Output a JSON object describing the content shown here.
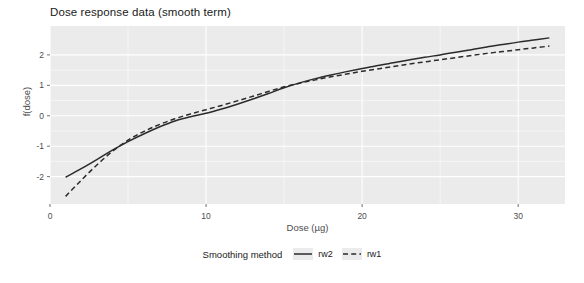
{
  "chart_data": {
    "type": "line",
    "title": "Dose response data (smooth term)",
    "xlabel": "Dose (µg)",
    "ylabel": "f(dose)",
    "xlim": [
      0,
      33
    ],
    "ylim": [
      -2.9,
      2.95
    ],
    "xticks": [
      0,
      10,
      20,
      30
    ],
    "xticklabels": [
      "0",
      "10",
      "20",
      "30"
    ],
    "yticks": [
      -2,
      -1,
      0,
      1,
      2
    ],
    "yticklabels": [
      "-2",
      "-1",
      "0",
      "1",
      "2"
    ],
    "grid": true,
    "grid_color": "#ffffff",
    "panel_color": "#ebebeb",
    "legend": {
      "title": "Smoothing method",
      "position": "bottom",
      "entries": [
        {
          "label": "rw2",
          "style": "solid",
          "color": "#2b2b2b"
        },
        {
          "label": "rw1",
          "style": "dashed",
          "color": "#2b2b2b"
        }
      ]
    },
    "series": [
      {
        "name": "rw2",
        "style": "solid",
        "color": "#2b2b2b",
        "x": [
          1.0,
          2.0,
          3.0,
          4.0,
          5.0,
          6.0,
          7.0,
          8.0,
          9.0,
          10.0,
          11.0,
          12.0,
          13.0,
          14.0,
          15.0,
          16.0,
          17.0,
          18.0,
          19.0,
          20.0,
          21.0,
          22.0,
          23.0,
          24.0,
          25.0,
          26.0,
          27.0,
          28.0,
          29.0,
          30.0,
          31.0,
          32.0
        ],
        "y": [
          -2.02,
          -1.74,
          -1.44,
          -1.13,
          -0.85,
          -0.6,
          -0.37,
          -0.17,
          -0.03,
          0.08,
          0.22,
          0.38,
          0.55,
          0.73,
          0.92,
          1.08,
          1.22,
          1.34,
          1.45,
          1.55,
          1.65,
          1.74,
          1.83,
          1.92,
          2.0,
          2.09,
          2.17,
          2.26,
          2.34,
          2.42,
          2.49,
          2.56
        ]
      },
      {
        "name": "rw1",
        "style": "dashed",
        "color": "#2b2b2b",
        "x": [
          1.0,
          2.0,
          3.0,
          4.0,
          5.0,
          6.0,
          7.0,
          8.0,
          9.0,
          10.0,
          11.0,
          12.0,
          13.0,
          14.0,
          15.0,
          16.0,
          17.0,
          18.0,
          19.0,
          20.0,
          21.0,
          22.0,
          23.0,
          24.0,
          25.0,
          26.0,
          27.0,
          28.0,
          29.0,
          30.0,
          31.0,
          32.0
        ],
        "y": [
          -2.65,
          -2.12,
          -1.62,
          -1.17,
          -0.8,
          -0.52,
          -0.29,
          -0.1,
          0.06,
          0.2,
          0.34,
          0.49,
          0.64,
          0.8,
          0.95,
          1.07,
          1.18,
          1.28,
          1.37,
          1.46,
          1.54,
          1.62,
          1.7,
          1.77,
          1.84,
          1.91,
          1.98,
          2.05,
          2.11,
          2.17,
          2.23,
          2.29
        ]
      }
    ]
  }
}
